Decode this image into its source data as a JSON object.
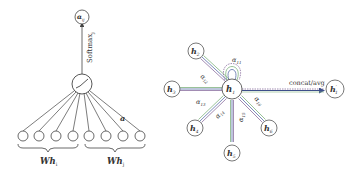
{
  "left_panel": {
    "title": "single attention mechanism",
    "output_node": {
      "label": "α",
      "sub": "ij"
    },
    "softmax_label": "Softmax",
    "softmax_sub": "j",
    "weight_label": "a",
    "group_i": {
      "label": "Wh",
      "sub": "i"
    },
    "group_j": {
      "label": "Wh",
      "sub": "j"
    },
    "input_count": 8
  },
  "right_panel": {
    "title": "multi-head attention",
    "center": {
      "label": "h",
      "sub": "1"
    },
    "neighbors": [
      {
        "id": "h2",
        "label": "h",
        "sub": "2"
      },
      {
        "id": "h3",
        "label": "h",
        "sub": "3"
      },
      {
        "id": "h4",
        "label": "h",
        "sub": "4"
      },
      {
        "id": "h5",
        "label": "h",
        "sub": "5"
      },
      {
        "id": "h6",
        "label": "h",
        "sub": "6"
      }
    ],
    "edge_labels": {
      "self": {
        "label": "α",
        "sub": "11"
      },
      "e12": {
        "label": "α",
        "sub": "12"
      },
      "e13": {
        "label": "α",
        "sub": "13"
      },
      "e14": {
        "label": "α",
        "sub": "14"
      },
      "e15": {
        "label": "α",
        "sub": "15"
      },
      "e16": {
        "label": "α",
        "sub": "16"
      }
    },
    "aggregation_label": "concat/avg",
    "output": {
      "label": "h",
      "prime": "′",
      "sub": "1"
    }
  },
  "colors": {
    "stroke": "#555555",
    "head_blue": "#5a6fa8",
    "head_green": "#7fb27f",
    "head_purple": "#8a6fa0"
  }
}
